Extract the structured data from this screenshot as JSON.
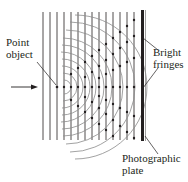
{
  "diagram": {
    "labels": {
      "point_object": [
        "Point",
        "object"
      ],
      "bright_fringes": [
        "Bright",
        "fringes"
      ],
      "photographic_plate": [
        "Photographic",
        "plate"
      ]
    },
    "elements": {
      "incident_plane_waves": "vertical wavefronts",
      "spherical_waves": "circular wavefronts from point object",
      "interference_dots": "intersection points",
      "plate": "photographic plate"
    },
    "colors": {
      "line": "#231f20",
      "arc": "#8a8a8a",
      "text": "#231f20"
    }
  }
}
